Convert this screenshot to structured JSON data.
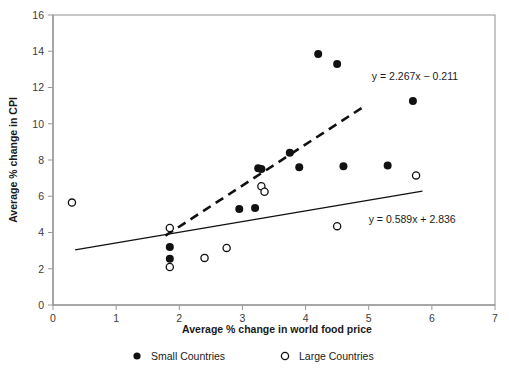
{
  "chart_data": {
    "type": "scatter",
    "title": "",
    "xlabel": "Average % change in world food price",
    "ylabel": "Average % change in CPI",
    "xlim": [
      0,
      7
    ],
    "ylim": [
      0,
      16
    ],
    "xticks": [
      "0",
      "1",
      "2",
      "3",
      "4",
      "5",
      "6",
      "7"
    ],
    "yticks": [
      "0",
      "2",
      "4",
      "6",
      "8",
      "10",
      "12",
      "14",
      "16"
    ],
    "grid": false,
    "legend_position": "bottom",
    "series": [
      {
        "name": "Small Countries",
        "marker": "filled-circle",
        "color": "#111111",
        "points": [
          [
            1.85,
            3.2
          ],
          [
            1.85,
            2.55
          ],
          [
            3.25,
            7.55
          ],
          [
            3.3,
            7.5
          ],
          [
            3.2,
            5.35
          ],
          [
            2.95,
            5.3
          ],
          [
            3.75,
            8.4
          ],
          [
            3.9,
            7.6
          ],
          [
            4.2,
            13.85
          ],
          [
            4.5,
            13.3
          ],
          [
            4.6,
            7.65
          ],
          [
            5.3,
            7.7
          ],
          [
            5.7,
            11.25
          ]
        ]
      },
      {
        "name": "Large Countries",
        "marker": "open-circle",
        "color": "#111111",
        "points": [
          [
            0.3,
            5.65
          ],
          [
            1.85,
            4.25
          ],
          [
            1.85,
            2.1
          ],
          [
            2.4,
            2.6
          ],
          [
            2.75,
            3.15
          ],
          [
            3.3,
            6.55
          ],
          [
            3.35,
            6.25
          ],
          [
            4.5,
            4.35
          ],
          [
            5.75,
            7.15
          ]
        ]
      }
    ],
    "trendlines": [
      {
        "name": "small-countries-trendline",
        "style": "dashed",
        "equation": "y = 2.267x − 0.211",
        "slope": 2.267,
        "intercept": -0.211,
        "x_start": 1.78,
        "x_end": 4.95,
        "label_x": 5.05,
        "label_y": 12.4
      },
      {
        "name": "large-countries-trendline",
        "style": "solid",
        "equation": "y = 0.589x + 2.836",
        "slope": 0.589,
        "intercept": 2.836,
        "x_start": 0.35,
        "x_end": 5.85,
        "label_x": 5.0,
        "label_y": 4.55
      }
    ]
  },
  "legend": {
    "items": [
      {
        "label": "Small Countries",
        "marker": "filled-circle"
      },
      {
        "label": "Large Countries",
        "marker": "open-circle"
      }
    ]
  }
}
